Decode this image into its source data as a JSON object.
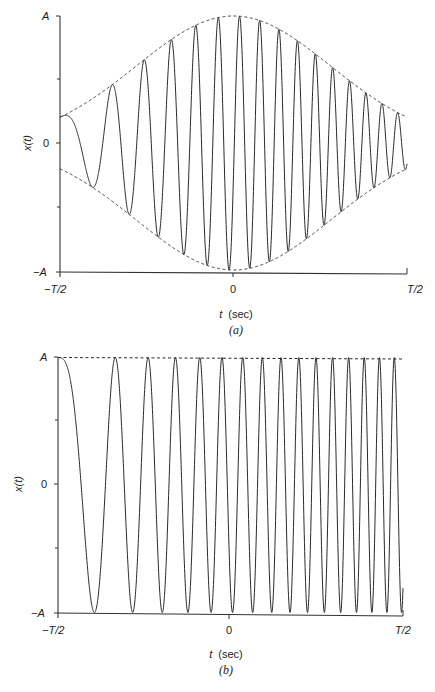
{
  "chart_data": [
    {
      "id": "a",
      "type": "line",
      "caption": "(a)",
      "description": "Gaussian-windowed chirp signal with dashed envelope",
      "xlabel_var": "t",
      "xlabel_unit": "(sec)",
      "ylabel": "x(t)",
      "x_ticks": [
        "−T/2",
        "0",
        "T/2"
      ],
      "y_ticks": [
        "A",
        "0",
        "−A"
      ],
      "xlim": [
        "-T/2",
        "T/2"
      ],
      "ylim": [
        "-A",
        "A"
      ],
      "envelope": {
        "shape": "gaussian",
        "center": 0.5,
        "sigma": 0.28,
        "style": "dashed"
      },
      "chirp": {
        "cycles_scale": 15.6,
        "exponent": 1.45,
        "start_phase": "peak"
      },
      "approx_cycles": 16
    },
    {
      "id": "b",
      "type": "line",
      "caption": "(b)",
      "description": "Constant-amplitude chirp signal with dashed reference at A",
      "xlabel_var": "t",
      "xlabel_unit": "(sec)",
      "ylabel": "x(t)",
      "x_ticks": [
        "−T/2",
        "0",
        "T/2"
      ],
      "y_ticks": [
        "A",
        "0",
        "−A"
      ],
      "xlim": [
        "-T/2",
        "T/2"
      ],
      "ylim": [
        "-A",
        "A"
      ],
      "envelope": {
        "shape": "constant",
        "style": "dashed-top"
      },
      "chirp": {
        "cycles_scale": 15.6,
        "exponent": 1.53,
        "start_phase": "peak"
      },
      "approx_cycles": 16
    }
  ],
  "panels": {
    "a": {
      "ylabel": "x(t)",
      "ytick_top": "A",
      "ytick_mid": "0",
      "ytick_bot": "−A",
      "xtick_left": "−T/2",
      "xtick_mid": "0",
      "xtick_right": "T/2",
      "xlabel_var": "t",
      "xlabel_unit": "(sec)",
      "caption": "(a)"
    },
    "b": {
      "ylabel": "x(t)",
      "ytick_top": "A",
      "ytick_mid": "0",
      "ytick_bot": "−A",
      "xtick_left": "−T/2",
      "xtick_mid": "0",
      "xtick_right": "T/2",
      "xlabel_var": "t",
      "xlabel_unit": "(sec)",
      "caption": "(b)"
    }
  },
  "colors": {
    "line": "#2a2a2a",
    "axis": "#333333",
    "background": "#ffffff"
  }
}
